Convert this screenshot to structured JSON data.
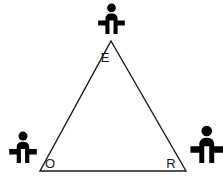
{
  "diagram": {
    "background_color": "#ffffff",
    "line_color": "#1a1a1a",
    "figure_color": "#000000",
    "label_color": "#1a1a1a",
    "stroke_width": 1.4,
    "triangle": {
      "name": "triangle-ORE",
      "vertices": [
        {
          "id": "E",
          "label": "E",
          "x": 111,
          "y": 41
        },
        {
          "id": "O",
          "label": "O",
          "x": 40,
          "y": 171
        },
        {
          "id": "R",
          "label": "R",
          "x": 186,
          "y": 171
        }
      ],
      "label_positions": [
        {
          "id": "E",
          "x": 105,
          "y": 62
        },
        {
          "id": "O",
          "x": 47,
          "y": 168
        },
        {
          "id": "R",
          "x": 167,
          "y": 168
        }
      ]
    },
    "figures": [
      {
        "id": "figure-top",
        "name": "person-icon-top",
        "near_vertex": "E",
        "x": 97,
        "y": 3,
        "width": 29,
        "height": 31
      },
      {
        "id": "figure-bottom-left",
        "name": "person-icon-bottom-left",
        "near_vertex": "O",
        "x": 8,
        "y": 131,
        "width": 30,
        "height": 32
      },
      {
        "id": "figure-bottom-right",
        "name": "person-icon-bottom-right",
        "near_vertex": "R",
        "x": 189,
        "y": 125,
        "width": 34,
        "height": 38
      }
    ]
  }
}
